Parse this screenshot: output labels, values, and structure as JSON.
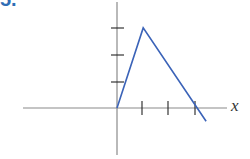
{
  "problem_label": "5.",
  "chart_data": {
    "type": "line",
    "title": "",
    "xlabel": "x",
    "ylabel": "",
    "x_ticks": [
      1,
      2,
      3
    ],
    "y_ticks": [
      1,
      2,
      3
    ],
    "x_tick_labels": [],
    "y_tick_labels": [],
    "xlim": [
      -3.6,
      4.2
    ],
    "ylim": [
      -1.8,
      4.0
    ],
    "grid": false,
    "legend": null,
    "series": [
      {
        "name": "f(x)",
        "color": "#3b63b8",
        "points": [
          {
            "x": 0,
            "y": 0
          },
          {
            "x": 1,
            "y": 3
          },
          {
            "x": 3.4,
            "y": -0.5
          }
        ]
      }
    ]
  },
  "colors": {
    "axis": "#8a8a8a",
    "tick": "#222222",
    "line": "#3b63b8",
    "label": "#2f6db5"
  }
}
